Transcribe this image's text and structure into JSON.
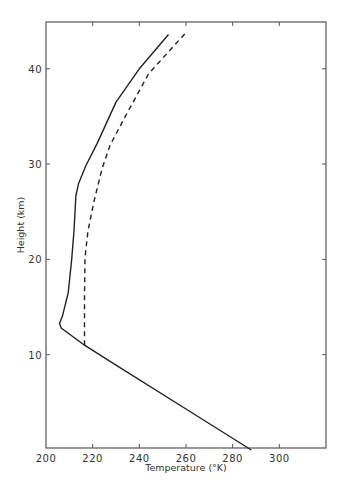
{
  "chart_data": {
    "type": "line",
    "title": "",
    "xlabel": "Temperature (°K)",
    "ylabel": "Height (km)",
    "xlim": [
      200,
      320
    ],
    "ylim": [
      0,
      44.7
    ],
    "x_ticks": [
      200,
      220,
      240,
      260,
      280,
      300
    ],
    "y_ticks": [
      10,
      20,
      30,
      40
    ],
    "grid": false,
    "legend": null,
    "series": [
      {
        "name": "solid profile",
        "style": "solid",
        "color": "#222222",
        "points": [
          {
            "T": 288.0,
            "h": 0.0
          },
          {
            "T": 260.0,
            "h": 4.3
          },
          {
            "T": 230.0,
            "h": 8.9
          },
          {
            "T": 216.5,
            "h": 11.0
          },
          {
            "T": 206.5,
            "h": 12.8
          },
          {
            "T": 205.8,
            "h": 13.3
          },
          {
            "T": 207.0,
            "h": 14.0
          },
          {
            "T": 209.5,
            "h": 16.5
          },
          {
            "T": 211.0,
            "h": 20.0
          },
          {
            "T": 212.0,
            "h": 23.0
          },
          {
            "T": 212.8,
            "h": 26.7
          },
          {
            "T": 214.0,
            "h": 28.0
          },
          {
            "T": 217.0,
            "h": 29.8
          },
          {
            "T": 222.0,
            "h": 32.2
          },
          {
            "T": 230.0,
            "h": 36.5
          },
          {
            "T": 240.0,
            "h": 40.0
          },
          {
            "T": 252.5,
            "h": 43.6
          }
        ]
      },
      {
        "name": "dashed profile",
        "style": "dashed",
        "color": "#222222",
        "points": [
          {
            "T": 216.5,
            "h": 11.0
          },
          {
            "T": 216.5,
            "h": 16.0
          },
          {
            "T": 216.7,
            "h": 20.2
          },
          {
            "T": 218.0,
            "h": 23.0
          },
          {
            "T": 220.5,
            "h": 26.0
          },
          {
            "T": 224.0,
            "h": 29.5
          },
          {
            "T": 227.5,
            "h": 32.0
          },
          {
            "T": 234.0,
            "h": 35.0
          },
          {
            "T": 244.0,
            "h": 39.5
          },
          {
            "T": 260.0,
            "h": 43.8
          }
        ]
      }
    ]
  },
  "labels": {
    "xlabel": "Temperature (°K)",
    "ylabel": "Height (km)",
    "x_tick_labels": [
      "200",
      "220",
      "240",
      "260",
      "280",
      "300"
    ],
    "y_tick_labels": [
      "10",
      "20",
      "30",
      "40"
    ]
  }
}
